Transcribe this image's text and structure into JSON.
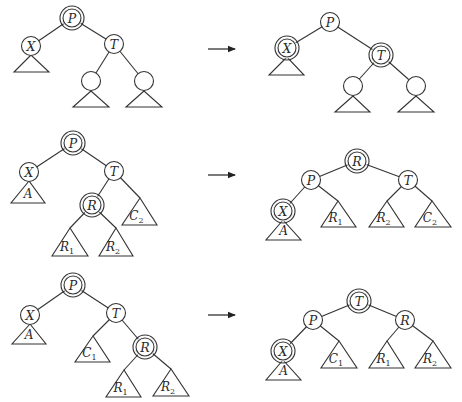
{
  "diagram": {
    "type": "tree-rotation-cases",
    "rows": [
      {
        "id": "case-1",
        "before": {
          "nodes": [
            {
              "id": "P",
              "label": "P",
              "x": 72,
              "y": 18,
              "double": true
            },
            {
              "id": "X",
              "label": "X",
              "x": 31,
              "y": 46,
              "double": false
            },
            {
              "id": "T",
              "label": "T",
              "x": 114,
              "y": 44,
              "double": false
            },
            {
              "id": "TL",
              "label": "",
              "x": 91,
              "y": 81,
              "double": false
            },
            {
              "id": "TR",
              "label": "",
              "x": 144,
              "y": 81,
              "double": false
            }
          ],
          "edges": [
            [
              "P",
              "X"
            ],
            [
              "P",
              "T"
            ],
            [
              "T",
              "TL"
            ],
            [
              "T",
              "TR"
            ]
          ],
          "subtrees": [
            {
              "label": "",
              "sub": "",
              "apex": [
                31,
                55
              ],
              "base_y": 72,
              "x1": 14,
              "x2": 49
            },
            {
              "label": "",
              "sub": "",
              "apex": [
                91,
                91
              ],
              "base_y": 107,
              "x1": 73,
              "x2": 109
            },
            {
              "label": "",
              "sub": "",
              "apex": [
                144,
                91
              ],
              "base_y": 107,
              "x1": 126,
              "x2": 162
            }
          ]
        },
        "after": {
          "nodes": [
            {
              "id": "P",
              "label": "P",
              "x": 330,
              "y": 22,
              "double": false
            },
            {
              "id": "X",
              "label": "X",
              "x": 287,
              "y": 48,
              "double": true
            },
            {
              "id": "T",
              "label": "T",
              "x": 381,
              "y": 55,
              "double": true
            },
            {
              "id": "TL",
              "label": "",
              "x": 353,
              "y": 86,
              "double": false
            },
            {
              "id": "TR",
              "label": "",
              "x": 416,
              "y": 86,
              "double": false
            }
          ],
          "edges": [
            [
              "P",
              "X"
            ],
            [
              "P",
              "T"
            ],
            [
              "T",
              "TL"
            ],
            [
              "T",
              "TR"
            ]
          ],
          "subtrees": [
            {
              "label": "",
              "sub": "",
              "apex": [
                287,
                57
              ],
              "base_y": 75,
              "x1": 269,
              "x2": 304
            },
            {
              "label": "",
              "sub": "",
              "apex": [
                353,
                96
              ],
              "base_y": 112,
              "x1": 335,
              "x2": 370
            },
            {
              "label": "",
              "sub": "",
              "apex": [
                416,
                96
              ],
              "base_y": 112,
              "x1": 398,
              "x2": 434
            }
          ]
        },
        "arrow": {
          "x1": 208,
          "x2": 235,
          "y": 49
        }
      },
      {
        "id": "case-2",
        "before": {
          "nodes": [
            {
              "id": "P",
              "label": "P",
              "x": 73,
              "y": 143,
              "double": true
            },
            {
              "id": "X",
              "label": "X",
              "x": 29,
              "y": 172,
              "double": false
            },
            {
              "id": "T",
              "label": "T",
              "x": 114,
              "y": 171,
              "double": false
            },
            {
              "id": "R",
              "label": "R",
              "x": 92,
              "y": 205,
              "double": true
            }
          ],
          "edges": [
            [
              "P",
              "X"
            ],
            [
              "P",
              "T"
            ],
            [
              "T",
              "R"
            ]
          ],
          "extra_edges": [
            [
              114,
              171,
              140,
              198
            ],
            [
              92,
              205,
              70,
              228
            ],
            [
              92,
              205,
              116,
              228
            ]
          ],
          "subtrees": [
            {
              "label": "A",
              "sub": "",
              "apex": [
                29,
                181
              ],
              "base_y": 203,
              "x1": 11,
              "x2": 45
            },
            {
              "label": "C",
              "sub": "2",
              "apex": [
                140,
                198
              ],
              "base_y": 225,
              "x1": 122,
              "x2": 157
            },
            {
              "label": "R",
              "sub": "1",
              "apex": [
                70,
                228
              ],
              "base_y": 256,
              "x1": 52,
              "x2": 88
            },
            {
              "label": "R",
              "sub": "2",
              "apex": [
                116,
                228
              ],
              "base_y": 256,
              "x1": 99,
              "x2": 133
            }
          ]
        },
        "after": {
          "nodes": [
            {
              "id": "R",
              "label": "R",
              "x": 357,
              "y": 161,
              "double": true
            },
            {
              "id": "P",
              "label": "P",
              "x": 311,
              "y": 180,
              "double": false
            },
            {
              "id": "T",
              "label": "T",
              "x": 408,
              "y": 180,
              "double": false
            },
            {
              "id": "X",
              "label": "X",
              "x": 283,
              "y": 211,
              "double": true
            }
          ],
          "edges": [
            [
              "R",
              "P"
            ],
            [
              "R",
              "T"
            ],
            [
              "P",
              "X"
            ]
          ],
          "extra_edges": [
            [
              311,
              180,
              338,
              201
            ],
            [
              408,
              180,
              387,
              201
            ],
            [
              408,
              180,
              432,
              201
            ]
          ],
          "subtrees": [
            {
              "label": "A",
              "sub": "",
              "apex": [
                283,
                220
              ],
              "base_y": 240,
              "x1": 266,
              "x2": 301
            },
            {
              "label": "R",
              "sub": "1",
              "apex": [
                338,
                201
              ],
              "base_y": 227,
              "x1": 321,
              "x2": 356
            },
            {
              "label": "R",
              "sub": "2",
              "apex": [
                387,
                201
              ],
              "base_y": 227,
              "x1": 369,
              "x2": 404
            },
            {
              "label": "C",
              "sub": "2",
              "apex": [
                432,
                201
              ],
              "base_y": 227,
              "x1": 415,
              "x2": 451
            }
          ]
        },
        "arrow": {
          "x1": 208,
          "x2": 235,
          "y": 175
        }
      },
      {
        "id": "case-3",
        "before": {
          "nodes": [
            {
              "id": "P",
              "label": "P",
              "x": 73,
              "y": 285,
              "double": true
            },
            {
              "id": "X",
              "label": "X",
              "x": 30,
              "y": 315,
              "double": false
            },
            {
              "id": "T",
              "label": "T",
              "x": 116,
              "y": 313,
              "double": false
            },
            {
              "id": "R",
              "label": "R",
              "x": 145,
              "y": 347,
              "double": true
            }
          ],
          "edges": [
            [
              "P",
              "X"
            ],
            [
              "P",
              "T"
            ],
            [
              "T",
              "R"
            ]
          ],
          "extra_edges": [
            [
              116,
              313,
              93,
              336
            ],
            [
              145,
              347,
              124,
              370
            ],
            [
              145,
              347,
              171,
              369
            ]
          ],
          "subtrees": [
            {
              "label": "A",
              "sub": "",
              "apex": [
                30,
                324
              ],
              "base_y": 344,
              "x1": 12,
              "x2": 46
            },
            {
              "label": "C",
              "sub": "1",
              "apex": [
                93,
                336
              ],
              "base_y": 362,
              "x1": 75,
              "x2": 110
            },
            {
              "label": "R",
              "sub": "1",
              "apex": [
                124,
                370
              ],
              "base_y": 397,
              "x1": 106,
              "x2": 141
            },
            {
              "label": "R",
              "sub": "2",
              "apex": [
                171,
                369
              ],
              "base_y": 396,
              "x1": 153,
              "x2": 189
            }
          ]
        },
        "after": {
          "nodes": [
            {
              "id": "T",
              "label": "T",
              "x": 359,
              "y": 301,
              "double": true
            },
            {
              "id": "P",
              "label": "P",
              "x": 313,
              "y": 320,
              "double": false
            },
            {
              "id": "R",
              "label": "R",
              "x": 405,
              "y": 320,
              "double": false
            },
            {
              "id": "X",
              "label": "X",
              "x": 283,
              "y": 351,
              "double": true
            }
          ],
          "edges": [
            [
              "T",
              "P"
            ],
            [
              "T",
              "R"
            ],
            [
              "P",
              "X"
            ]
          ],
          "extra_edges": [
            [
              313,
              320,
              339,
              341
            ],
            [
              405,
              320,
              387,
              341
            ],
            [
              405,
              320,
              433,
              341
            ]
          ],
          "subtrees": [
            {
              "label": "A",
              "sub": "",
              "apex": [
                283,
                360
              ],
              "base_y": 380,
              "x1": 266,
              "x2": 301
            },
            {
              "label": "C",
              "sub": "1",
              "apex": [
                339,
                341
              ],
              "base_y": 368,
              "x1": 321,
              "x2": 357
            },
            {
              "label": "R",
              "sub": "1",
              "apex": [
                387,
                341
              ],
              "base_y": 368,
              "x1": 369,
              "x2": 404
            },
            {
              "label": "R",
              "sub": "2",
              "apex": [
                433,
                341
              ],
              "base_y": 368,
              "x1": 415,
              "x2": 451
            }
          ]
        },
        "arrow": {
          "x1": 208,
          "x2": 235,
          "y": 315
        }
      }
    ],
    "style": {
      "node_radius": 9.5,
      "ring_radius": 12,
      "stroke": "#333333",
      "background": "#ffffff"
    }
  }
}
